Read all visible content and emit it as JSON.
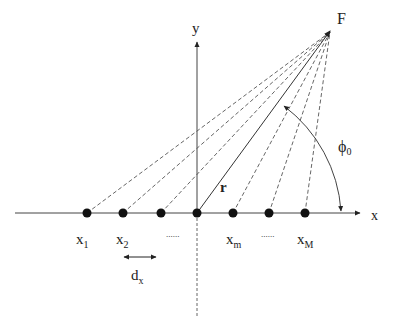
{
  "diagram": {
    "axes": {
      "x_label": "x",
      "y_label": "y"
    },
    "focus_label": "F",
    "angle_label": "ϕ",
    "angle_sub": "0",
    "vector_label": "r",
    "spacing_label": "d",
    "spacing_sub": "x",
    "points": [
      {
        "base": "x",
        "sub": "1"
      },
      {
        "base": "x",
        "sub": "2"
      },
      {
        "base": "",
        "sub": ""
      },
      {
        "base": "",
        "sub": ""
      },
      {
        "base": "x",
        "sub": "m"
      },
      {
        "base": "",
        "sub": ""
      },
      {
        "base": "x",
        "sub": "M"
      }
    ],
    "ellipsis": "......",
    "colors": {
      "line": "#333333",
      "dash": "#555555",
      "dot": "#111111"
    }
  }
}
